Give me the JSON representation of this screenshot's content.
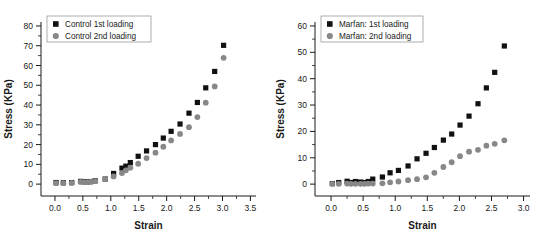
{
  "figure": {
    "panels": [
      {
        "id": "control-panel",
        "xlabel": "Strain",
        "ylabel": "Stress (KPa)",
        "xlim": [
          -0.25,
          3.6
        ],
        "ylim": [
          -6,
          82
        ],
        "xticks": [
          "0.0",
          "0.5",
          "1.0",
          "1.5",
          "2.0",
          "2.5",
          "3.0",
          "3.5"
        ],
        "xtick_values": [
          0.0,
          0.5,
          1.0,
          1.5,
          2.0,
          2.5,
          3.0,
          3.5
        ],
        "yticks": [
          "0",
          "10",
          "20",
          "30",
          "40",
          "50",
          "60",
          "70",
          "80"
        ],
        "ytick_values": [
          0,
          10,
          20,
          30,
          40,
          50,
          60,
          70,
          80
        ],
        "legend": [
          {
            "label": "Control 1st loading",
            "marker": "square",
            "color": "#111111"
          },
          {
            "label": "Control 2nd loading",
            "marker": "circle",
            "color": "#888888"
          }
        ]
      },
      {
        "id": "marfan-panel",
        "xlabel": "Strain",
        "ylabel": "Stress (KPa)",
        "xlim": [
          -0.25,
          3.1
        ],
        "ylim": [
          -4.5,
          61.5
        ],
        "xticks": [
          "0.0",
          "0.5",
          "1.0",
          "1.5",
          "2.0",
          "2.5",
          "3.0"
        ],
        "xtick_values": [
          0.0,
          0.5,
          1.0,
          1.5,
          2.0,
          2.5,
          3.0
        ],
        "yticks": [
          "0",
          "10",
          "20",
          "30",
          "40",
          "50",
          "60"
        ],
        "ytick_values": [
          0,
          10,
          20,
          30,
          40,
          50,
          60
        ],
        "legend": [
          {
            "label": "Marfan: 1st loading",
            "marker": "square",
            "color": "#111111"
          },
          {
            "label": "Marfan: 2nd loading",
            "marker": "circle",
            "color": "#888888"
          }
        ]
      }
    ]
  },
  "chart_data": [
    {
      "type": "scatter",
      "title": "",
      "xlabel": "Strain",
      "ylabel": "Stress (KPa)",
      "xlim": [
        -0.25,
        3.6
      ],
      "ylim": [
        -6,
        82
      ],
      "grid": false,
      "legend_position": "top-left",
      "series": [
        {
          "name": "Control 1st loading",
          "marker": "square",
          "color": "#111111",
          "x": [
            0.02,
            0.15,
            0.3,
            0.46,
            0.52,
            0.58,
            0.64,
            0.72,
            0.9,
            1.05,
            1.2,
            1.27,
            1.35,
            1.49,
            1.64,
            1.8,
            1.94,
            2.08,
            2.24,
            2.4,
            2.55,
            2.7,
            2.86,
            3.02
          ],
          "y": [
            0.8,
            0.7,
            0.8,
            1.4,
            1.3,
            1.2,
            1.3,
            1.7,
            2.6,
            5.4,
            8.1,
            9.1,
            10.9,
            14.1,
            16.8,
            20.0,
            23.3,
            26.7,
            30.4,
            35.9,
            41.3,
            48.7,
            57.0,
            70.2
          ]
        },
        {
          "name": "Control 2nd loading",
          "marker": "circle",
          "color": "#888888",
          "x": [
            0.02,
            0.15,
            0.3,
            0.46,
            0.52,
            0.58,
            0.64,
            0.72,
            0.9,
            1.05,
            1.2,
            1.27,
            1.35,
            1.49,
            1.64,
            1.8,
            1.94,
            2.08,
            2.24,
            2.4,
            2.55,
            2.7,
            2.86,
            3.02
          ],
          "y": [
            0.5,
            0.5,
            0.6,
            1.1,
            1.0,
            1.0,
            1.1,
            1.5,
            2.6,
            3.9,
            5.6,
            7.0,
            8.3,
            10.3,
            13.2,
            15.9,
            18.9,
            22.1,
            25.4,
            28.8,
            33.9,
            41.2,
            49.4,
            63.9
          ]
        }
      ]
    },
    {
      "type": "scatter",
      "title": "",
      "xlabel": "Strain",
      "ylabel": "Stress (KPa)",
      "xlim": [
        -0.25,
        3.1
      ],
      "ylim": [
        -4.5,
        61.5
      ],
      "grid": false,
      "legend_position": "top-left",
      "series": [
        {
          "name": "Marfan: 1st loading",
          "marker": "square",
          "color": "#111111",
          "x": [
            0.02,
            0.12,
            0.25,
            0.31,
            0.38,
            0.46,
            0.52,
            0.58,
            0.65,
            0.8,
            0.92,
            1.05,
            1.2,
            1.34,
            1.48,
            1.61,
            1.75,
            1.88,
            2.01,
            2.15,
            2.29,
            2.42,
            2.55,
            2.7
          ],
          "y": [
            0.2,
            0.6,
            1.1,
            0.6,
            1.0,
            0.8,
            0.6,
            1.0,
            1.9,
            2.7,
            4.3,
            5.2,
            6.9,
            9.6,
            11.7,
            13.9,
            16.7,
            19.0,
            22.4,
            25.8,
            30.5,
            36.5,
            42.4,
            52.4
          ]
        },
        {
          "name": "Marfan: 2nd loading",
          "marker": "circle",
          "color": "#888888",
          "x": [
            0.02,
            0.12,
            0.25,
            0.31,
            0.38,
            0.46,
            0.52,
            0.58,
            0.65,
            0.8,
            0.92,
            1.05,
            1.2,
            1.34,
            1.48,
            1.61,
            1.75,
            1.88,
            2.01,
            2.15,
            2.29,
            2.42,
            2.55,
            2.7
          ],
          "y": [
            0.1,
            0.1,
            0.2,
            0.1,
            0.1,
            0.1,
            0.1,
            0.2,
            0.2,
            0.3,
            0.7,
            1.0,
            1.5,
            1.9,
            2.6,
            4.3,
            6.5,
            8.3,
            10.6,
            12.3,
            13.0,
            14.6,
            15.3,
            16.6
          ]
        }
      ]
    }
  ]
}
